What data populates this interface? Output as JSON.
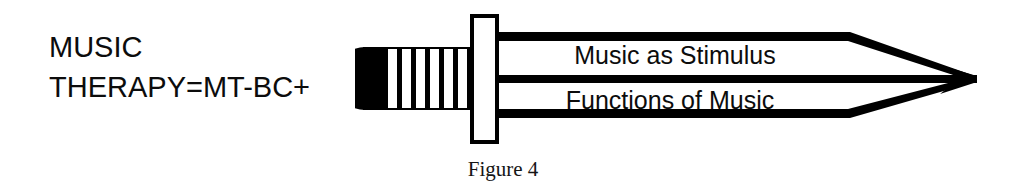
{
  "figure": {
    "caption": "Figure 4",
    "background_color": "#ffffff",
    "ink_color": "#000000"
  },
  "label": {
    "line1": "MUSIC",
    "line2": "THERAPY=MT-BC+"
  },
  "diagram": {
    "type": "sword-arrow",
    "icon_name": "sword-arrow-icon",
    "pommel_name": "sword-pommel-icon",
    "grip_name": "sword-grip-icon",
    "grip_stripe_count": 6,
    "crossguard_name": "sword-crossguard-icon",
    "blade_name": "sword-blade-icon",
    "tip_name": "sword-tip-icon",
    "bands": [
      {
        "label": "Music as Stimulus"
      },
      {
        "label": "Functions of Music"
      }
    ]
  }
}
